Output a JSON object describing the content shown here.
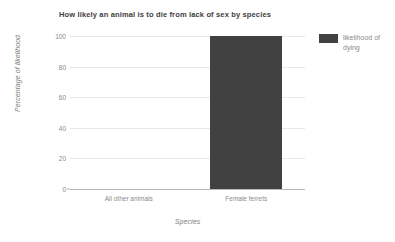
{
  "chart_data": {
    "type": "bar",
    "title": "How likely an animal is to die from lack of sex by species",
    "xlabel": "Species",
    "ylabel": "Percentage of likelihood",
    "categories": [
      "All other animals",
      "Female ferrets"
    ],
    "series": [
      {
        "name": "likelihood of dying",
        "values": [
          0,
          100
        ],
        "color": "#414141"
      }
    ],
    "yticks": [
      0,
      20,
      40,
      60,
      80,
      100
    ],
    "ylim": [
      0,
      100
    ],
    "grid": true,
    "legend_position": "right",
    "legend_entries": [
      "likelihood of dying"
    ],
    "background_color": "#ffffff",
    "axis_color": "#b9b9b9",
    "gridline_color": "#e8e8e8",
    "tick_label_color": "#8a8a8a",
    "title_color": "#3d3d3d"
  }
}
